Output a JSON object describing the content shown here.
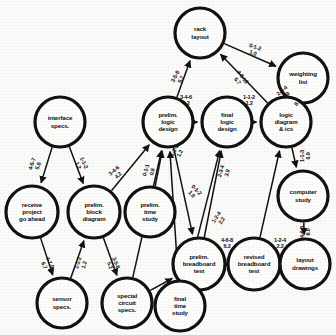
{
  "diagram": {
    "colors": {
      "background": "#fbfbfa",
      "stroke": "#111111",
      "node_fill": "#fdfdfc"
    },
    "nodes": [
      {
        "id": "rack",
        "label": "rack\nlayout",
        "cx": 200,
        "cy": 33,
        "r": 25
      },
      {
        "id": "weighting",
        "label": "weighting\nlist",
        "cx": 303,
        "cy": 78,
        "r": 25
      },
      {
        "id": "interface",
        "label": "interface\nspecs.",
        "cx": 60,
        "cy": 122,
        "r": 25
      },
      {
        "id": "prelimlogic",
        "label": "prelim.\nlogic\ndesign",
        "cx": 168,
        "cy": 122,
        "r": 25
      },
      {
        "id": "finallogic",
        "label": "final\nlogic\ndesign",
        "cx": 227,
        "cy": 122,
        "r": 25
      },
      {
        "id": "logicdiag",
        "label": "logic\ndiagram\n& ics",
        "cx": 286,
        "cy": 122,
        "r": 25
      },
      {
        "id": "computer",
        "label": "computer\nstudy",
        "cx": 303,
        "cy": 196,
        "r": 25
      },
      {
        "id": "receive",
        "label": "receive\nproject\ngo ahead",
        "cx": 32,
        "cy": 212,
        "r": 26
      },
      {
        "id": "prelimblock",
        "label": "prelim.\nblock\ndiagram",
        "cx": 94,
        "cy": 212,
        "r": 26
      },
      {
        "id": "prelimtime",
        "label": "prelim.\ntime\nstudy",
        "cx": 150,
        "cy": 212,
        "r": 25
      },
      {
        "id": "prelimbb",
        "label": "prelim.\nbreadboard\ntest",
        "cx": 199,
        "cy": 264,
        "r": 26
      },
      {
        "id": "revisedbb",
        "label": "revised\nbreadboard\ntest",
        "cx": 254,
        "cy": 264,
        "r": 26
      },
      {
        "id": "layout",
        "label": "layout\ndrawings",
        "cx": 305,
        "cy": 264,
        "r": 25
      },
      {
        "id": "sensor",
        "label": "sensor\nspecs.",
        "cx": 62,
        "cy": 303,
        "r": 25
      },
      {
        "id": "special",
        "label": "special\ncircuit\nspecs.",
        "cx": 127,
        "cy": 303,
        "r": 25
      },
      {
        "id": "finaltime",
        "label": "final\ntime\nstudy",
        "cx": 180,
        "cy": 306,
        "r": 25
      }
    ],
    "edges": [
      {
        "from": "prelimlogic",
        "to": "rack",
        "estimate": "3-5-8",
        "expected": "5.7",
        "lx": 178,
        "ly": 78,
        "rot": -62
      },
      {
        "from": "logicdiag",
        "to": "rack",
        "estimate": "4-8-12",
        "expected": "6.7",
        "lx": 240,
        "ly": 79,
        "rot": 52
      },
      {
        "from": "rack",
        "to": "weighting",
        "estimate": "0-1-2",
        "expected": "1.0",
        "lx": 254,
        "ly": 50,
        "rot": 19
      },
      {
        "from": "logicdiag",
        "to": "weighting",
        "estimate": "2-3-4",
        "expected": "3.9",
        "lx": 284,
        "ly": 93,
        "rot": -42
      },
      {
        "from": "weighting",
        "to": "logicdiag",
        "estimate": "8.0",
        "expected": "",
        "lx": 300,
        "ly": 104,
        "rot": -58
      },
      {
        "from": "logicdiag",
        "to": "computer",
        "estimate": "1-1-3",
        "expected": "0.9",
        "lx": 305,
        "ly": 156,
        "rot": -90
      },
      {
        "from": "computer",
        "to": "layout",
        "estimate": "4-6-8",
        "expected": "6.0",
        "lx": 305,
        "ly": 232,
        "rot": -90
      },
      {
        "from": "prelimlogic",
        "to": "finallogic",
        "estimate": "3-4-6",
        "expected": "4.2",
        "lx": 186,
        "ly": 100,
        "rot": 0
      },
      {
        "from": "finallogic",
        "to": "logicdiag",
        "estimate": "1-1-2",
        "expected": "1.2",
        "lx": 249,
        "ly": 100,
        "rot": 0
      },
      {
        "from": "interface",
        "to": "receive",
        "estimate": "4-5-7",
        "expected": "5.8",
        "lx": 35,
        "ly": 165,
        "rot": -70
      },
      {
        "from": "interface",
        "to": "prelimblock",
        "estimate": "1-1-2",
        "expected": "1.2",
        "lx": 81,
        "ly": 164,
        "rot": 66
      },
      {
        "from": "receive",
        "to": "sensor",
        "estimate": "4-7-9",
        "expected": "6.7",
        "lx": 47,
        "ly": 264,
        "rot": 63
      },
      {
        "from": "sensor",
        "to": "prelimblock",
        "estimate": "1-1-2",
        "expected": "1.2",
        "lx": 81,
        "ly": 264,
        "rot": -73
      },
      {
        "from": "prelimblock",
        "to": "special",
        "estimate": "3-5-8",
        "expected": "5.2",
        "lx": 113,
        "ly": 264,
        "rot": 68
      },
      {
        "from": "prelimblock",
        "to": "prelimlogic",
        "estimate": "3-4-6",
        "expected": "4.2",
        "lx": 116,
        "ly": 173,
        "rot": -42
      },
      {
        "from": "prelimtime",
        "to": "prelimlogic",
        "estimate": "0-1-1",
        "expected": "0.8",
        "lx": 149,
        "ly": 171,
        "rot": -75
      },
      {
        "from": "special",
        "to": "prelimlogic",
        "estimate": "1-1-2",
        "expected": "1.2",
        "lx": 177,
        "ly": 152,
        "rot": -62
      },
      {
        "from": "finaltime",
        "to": "finallogic",
        "estimate": "2-3-4",
        "expected": "3.9",
        "lx": 224,
        "ly": 172,
        "rot": -75
      },
      {
        "from": "prelimlogic",
        "to": "prelimbb",
        "estimate": "0-1-2",
        "expected": "1.0",
        "lx": 194,
        "ly": 192,
        "rot": 47
      },
      {
        "from": "prelimbb",
        "to": "finallogic",
        "estimate": "1-2-4",
        "expected": "2.2",
        "lx": 219,
        "ly": 219,
        "rot": -56
      },
      {
        "from": "prelimbb",
        "to": "revisedbb",
        "estimate": "4-6-8",
        "expected": "6.2",
        "lx": 227,
        "ly": 243,
        "rot": 0
      },
      {
        "from": "revisedbb",
        "to": "layout",
        "estimate": "1-2-4",
        "expected": "2.2",
        "lx": 280,
        "ly": 243,
        "rot": 0
      },
      {
        "from": "revisedbb",
        "to": "logicdiag",
        "estimate": "",
        "expected": "",
        "lx": 0,
        "ly": 0,
        "rot": 0
      },
      {
        "from": "finaltime",
        "to": "prelimlogic",
        "estimate": "",
        "expected": "",
        "lx": 0,
        "ly": 0,
        "rot": 0
      },
      {
        "from": "special",
        "to": "prelimbb",
        "estimate": "",
        "expected": "",
        "lx": 0,
        "ly": 0,
        "rot": 0
      }
    ]
  }
}
